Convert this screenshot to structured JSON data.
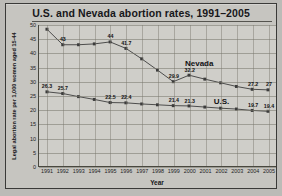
{
  "chart_data": {
    "type": "line",
    "title": "U.S. and Nevada abortion rates, 1991–2005",
    "xlabel": "Year",
    "ylabel": "Legal abortion rate per 1,000 women aged 15-44",
    "x": [
      1991,
      1992,
      1993,
      1994,
      1995,
      1996,
      1997,
      1998,
      1999,
      2000,
      2001,
      2002,
      2003,
      2004,
      2005
    ],
    "xticklabels": [
      "1991",
      "1992",
      "1993",
      "1994",
      "1995",
      "1996",
      "1997",
      "1998",
      "1999",
      "2000",
      "2001",
      "2002",
      "2003",
      "2004",
      "2005"
    ],
    "yticks": [
      0,
      5,
      10,
      15,
      20,
      25,
      30,
      35,
      40,
      45,
      50
    ],
    "yticklabels": [
      "0",
      "5",
      "10",
      "15",
      "20",
      "25",
      "30",
      "35",
      "40",
      "45",
      "50"
    ],
    "ylim": [
      0,
      50
    ],
    "grid": true,
    "legend": "inline-labels",
    "series": [
      {
        "name": "Nevada",
        "color": "#3c3c3c",
        "values": [
          48.5,
          43.0,
          43.0,
          43.3,
          44.0,
          41.7,
          38.0,
          34.0,
          29.9,
          32.2,
          30.8,
          29.5,
          28.2,
          27.2,
          27.0
        ],
        "labels": [
          "",
          "43",
          "",
          "",
          "44",
          "41.7",
          "",
          "",
          "29.9",
          "32.2",
          "",
          "",
          "",
          "27.2",
          "27"
        ],
        "label_position": {
          "x": 2000.6,
          "y": 36.5
        }
      },
      {
        "name": "U.S.",
        "color": "#3c3c3c",
        "values": [
          26.3,
          25.7,
          24.6,
          23.6,
          22.5,
          22.4,
          22.0,
          21.7,
          21.4,
          21.3,
          20.9,
          20.5,
          20.2,
          19.7,
          19.4
        ],
        "labels": [
          "26.3",
          "25.7",
          "",
          "",
          "22.5",
          "22.4",
          "",
          "",
          "21.4",
          "21.3",
          "",
          "",
          "",
          "19.7",
          "19.4"
        ],
        "label_position": {
          "x": 2002.0,
          "y": 23.2
        }
      }
    ]
  }
}
